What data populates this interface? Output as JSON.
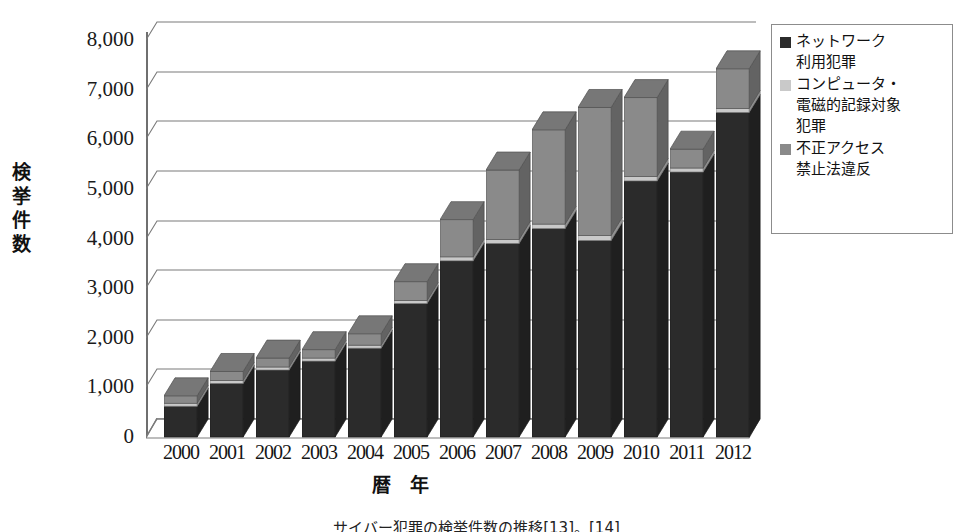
{
  "axes": {
    "y_title": "検挙件数",
    "y_title_chars": [
      "検",
      "挙",
      "件",
      "数"
    ],
    "x_title": "暦　年",
    "y_ticks": [
      "8,000",
      "7,000",
      "6,000",
      "5,000",
      "4,000",
      "3,000",
      "2,000",
      "1,000",
      "0"
    ]
  },
  "legend": {
    "items": [
      {
        "label": "ネットワーク\n利用犯罪",
        "color": "#2b2b2b",
        "name": "network-crime"
      },
      {
        "label": "コンピュータ・\n電磁的記録対象\n犯罪",
        "color": "#c9c9c9",
        "name": "computer-record-crime"
      },
      {
        "label": "不正アクセス\n禁止法違反",
        "color": "#8a8a8a",
        "name": "unauthorized-access"
      }
    ]
  },
  "caption": {
    "text": "サイバー犯罪の検挙件数の推移[13]。[14]"
  },
  "colors": {
    "series_dark": "#2b2b2b",
    "series_light": "#c9c9c9",
    "series_mid": "#8a8a8a",
    "gridline": "#7a7a7a",
    "axis": "#6f6f6f",
    "background": "#ffffff"
  },
  "chart_data": {
    "type": "bar",
    "title": "",
    "subtitle": "",
    "stacked": true,
    "three_d": true,
    "xlabel": "暦　年",
    "ylabel": "検挙件数",
    "ylim": [
      0,
      8000
    ],
    "ytick_step": 1000,
    "grid": true,
    "legend_position": "right",
    "categories": [
      "2000",
      "2001",
      "2002",
      "2003",
      "2004",
      "2005",
      "2006",
      "2007",
      "2008",
      "2009",
      "2010",
      "2011",
      "2012"
    ],
    "series": [
      {
        "name": "ネットワーク利用犯罪",
        "color": "#2b2b2b",
        "values": [
          620,
          1080,
          1350,
          1530,
          1790,
          2690,
          3550,
          3900,
          4200,
          3960,
          5160,
          5340,
          6540
        ]
      },
      {
        "name": "コンピュータ・電磁的記録対象犯罪",
        "color": "#c9c9c9",
        "values": [
          60,
          60,
          60,
          60,
          60,
          60,
          80,
          80,
          90,
          100,
          90,
          80,
          80
        ]
      },
      {
        "name": "不正アクセス禁止法違反",
        "color": "#8a8a8a",
        "values": [
          150,
          180,
          180,
          170,
          230,
          380,
          750,
          1400,
          1900,
          2580,
          1590,
          380,
          800
        ]
      }
    ],
    "totals": [
      830,
      1320,
      1590,
      1760,
      2080,
      3130,
      4380,
      5380,
      6190,
      6640,
      6840,
      5800,
      7420
    ]
  }
}
